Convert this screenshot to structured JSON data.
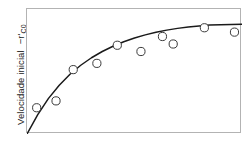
{
  "figure": {
    "background_color": "#ffffff",
    "frame_color": "#b3b3b3",
    "curve_color": "#1a1a1a",
    "marker_edge_color": "#3a3a3a",
    "marker_fill_color": "#ffffff"
  },
  "ylabel": {
    "text_main": "Velocidade inicial",
    "text_symbol_prefix": "−r'",
    "text_symbol_subscript": "C0",
    "full_text": "Velocidade inicial  −r'C0"
  },
  "chart_data": {
    "type": "scatter",
    "title": "",
    "subtitle": "",
    "xlabel": "",
    "ylabel": "Velocidade inicial  −r'C0",
    "grid": false,
    "legend": "none",
    "xlim": [
      0,
      10
    ],
    "ylim": [
      0,
      10
    ],
    "x_tick_labels": [],
    "y_tick_labels": [],
    "series": [
      {
        "name": "Pontos experimentais",
        "marker": "open-circle",
        "x": [
          0.45,
          1.35,
          2.15,
          3.25,
          4.2,
          5.3,
          6.3,
          6.8,
          8.25,
          9.65
        ],
        "y": [
          2.1,
          2.65,
          5.15,
          5.65,
          7.1,
          6.6,
          7.8,
          7.2,
          8.5,
          8.15
        ]
      },
      {
        "name": "Curva ajustada",
        "marker": "none",
        "line": "solid",
        "x": [
          0.0,
          0.5,
          1.0,
          1.5,
          2.0,
          2.5,
          3.0,
          3.5,
          4.0,
          4.5,
          5.0,
          5.5,
          6.0,
          6.5,
          7.0,
          7.5,
          8.0,
          8.5,
          9.0,
          9.5,
          10.0
        ],
        "y": [
          0.0,
          1.55,
          2.85,
          3.9,
          4.78,
          5.5,
          6.1,
          6.6,
          7.02,
          7.38,
          7.68,
          7.93,
          8.14,
          8.31,
          8.45,
          8.56,
          8.65,
          8.71,
          8.75,
          8.77,
          8.78
        ]
      }
    ]
  }
}
